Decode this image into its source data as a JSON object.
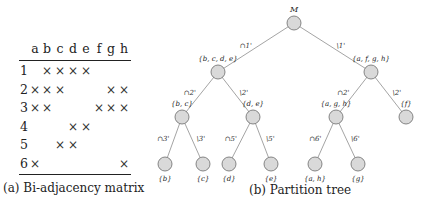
{
  "figure_a": {
    "caption": "(a) Bi-adjacency matrix",
    "columns": [
      "a",
      "b",
      "c",
      "d",
      "e",
      "f",
      "g",
      "h"
    ],
    "rows": [
      {
        "label": "1",
        "marks": [
          "b",
          "c",
          "d",
          "e"
        ]
      },
      {
        "label": "2",
        "marks": [
          "a",
          "b",
          "c",
          "g",
          "h"
        ]
      },
      {
        "label": "3",
        "marks": [
          "a",
          "b",
          "f",
          "g",
          "h"
        ]
      },
      {
        "label": "4",
        "marks": [
          "d",
          "e"
        ]
      },
      {
        "label": "5",
        "marks": [
          "c",
          "d"
        ]
      },
      {
        "label": "6",
        "marks": [
          "a",
          "h"
        ]
      }
    ],
    "mark_symbol": "×"
  },
  "figure_b": {
    "caption": "(b) Partition tree",
    "nodes": [
      {
        "id": "root",
        "label": "M",
        "x": 294,
        "y": 23
      },
      {
        "id": "n1",
        "label": "{b, c, d, e}",
        "x": 218,
        "y": 72
      },
      {
        "id": "n2",
        "label": "{a, f, g, h}",
        "x": 371,
        "y": 72
      },
      {
        "id": "n3",
        "label": "{b, c}",
        "x": 182,
        "y": 117
      },
      {
        "id": "n4",
        "label": "{d, e}",
        "x": 253,
        "y": 117
      },
      {
        "id": "n5",
        "label": "{a, g, h}",
        "x": 336,
        "y": 117
      },
      {
        "id": "n6",
        "label": "{f}",
        "x": 406,
        "y": 117
      },
      {
        "id": "n7",
        "label": "{b}",
        "x": 165,
        "y": 164
      },
      {
        "id": "n8",
        "label": "{c}",
        "x": 203,
        "y": 164
      },
      {
        "id": "n9",
        "label": "{d}",
        "x": 229,
        "y": 164
      },
      {
        "id": "n10",
        "label": "{e}",
        "x": 271,
        "y": 164
      },
      {
        "id": "n11",
        "label": "{a, h}",
        "x": 315,
        "y": 164
      },
      {
        "id": "n12",
        "label": "{g}",
        "x": 358,
        "y": 164
      }
    ],
    "edges": [
      {
        "from": "root",
        "to": "n1",
        "label": "∩1'"
      },
      {
        "from": "root",
        "to": "n2",
        "label": "\\1'"
      },
      {
        "from": "n1",
        "to": "n3",
        "label": "∩2'"
      },
      {
        "from": "n1",
        "to": "n4",
        "label": "\\2'"
      },
      {
        "from": "n2",
        "to": "n5",
        "label": "∩2'"
      },
      {
        "from": "n2",
        "to": "n6",
        "label": "\\2'"
      },
      {
        "from": "n3",
        "to": "n7",
        "label": "∩3'"
      },
      {
        "from": "n3",
        "to": "n8",
        "label": "\\3'"
      },
      {
        "from": "n4",
        "to": "n9",
        "label": "∩5'"
      },
      {
        "from": "n4",
        "to": "n10",
        "label": "\\5'"
      },
      {
        "from": "n5",
        "to": "n11",
        "label": "∩6'"
      },
      {
        "from": "n5",
        "to": "n12",
        "label": "\\6'"
      }
    ],
    "node_fill": "#d9d9d9",
    "node_stroke": "#6b6b6b",
    "edge_color": "#9a9a9a"
  }
}
